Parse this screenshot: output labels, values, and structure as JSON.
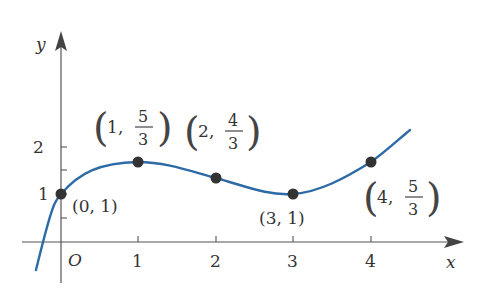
{
  "diagram": {
    "axes": {
      "x_label": "x",
      "y_label": "y",
      "origin_label": "O",
      "x_ticks": [
        "1",
        "2",
        "3",
        "4"
      ],
      "y_ticks": [
        "1",
        "2"
      ],
      "y_minor_ticks": [
        0.5,
        1.5
      ]
    },
    "curve": {
      "description": "cubic curve y = x^3/6 - x^2 + 3x/2 + 1",
      "color": "#2d6aa6"
    },
    "points": [
      {
        "x": 0,
        "y": "1",
        "label_x": "0",
        "label_y": "1"
      },
      {
        "x": 1,
        "y": "5/3",
        "label_x": "1",
        "label_num": "5",
        "label_den": "3"
      },
      {
        "x": 2,
        "y": "4/3",
        "label_x": "2",
        "label_num": "4",
        "label_den": "3"
      },
      {
        "x": 3,
        "y": "1",
        "label_x": "3",
        "label_y": "1"
      },
      {
        "x": 4,
        "y": "5/3",
        "label_x": "4",
        "label_num": "5",
        "label_den": "3"
      }
    ],
    "point_color": "#333333"
  }
}
